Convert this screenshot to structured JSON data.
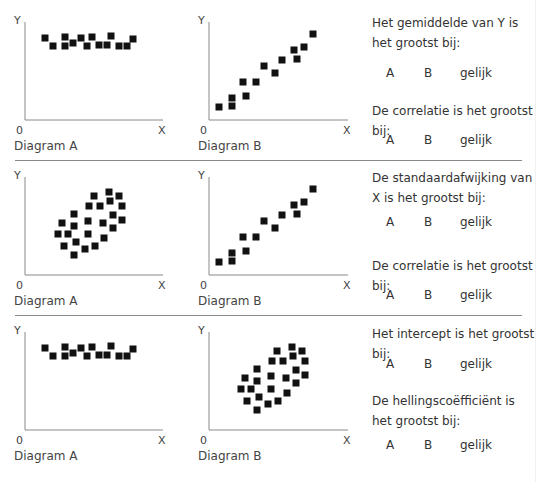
{
  "axis_labels": {
    "y": "Y",
    "x": "X",
    "origin": "0"
  },
  "rows": [
    {
      "diagram_a": {
        "caption": "Diagram A"
      },
      "diagram_b": {
        "caption": "Diagram B"
      },
      "questions": [
        {
          "text": "Het gemiddelde van Y is het grootst bij:",
          "options": [
            "A",
            "B",
            "gelijk"
          ]
        },
        {
          "text": "De correlatie is het grootst bij:",
          "options": [
            "A",
            "B",
            "gelijk"
          ]
        }
      ]
    },
    {
      "diagram_a": {
        "caption": "Diagram A"
      },
      "diagram_b": {
        "caption": "Diagram B"
      },
      "questions": [
        {
          "text": "De standaardafwijking van X is het grootst bij:",
          "options": [
            "A",
            "B",
            "gelijk"
          ]
        },
        {
          "text": "De correlatie is het grootst bij:",
          "options": [
            "A",
            "B",
            "gelijk"
          ]
        }
      ]
    },
    {
      "diagram_a": {
        "caption": "Diagram A"
      },
      "diagram_b": {
        "caption": "Diagram B"
      },
      "questions": [
        {
          "text": "Het intercept is het grootst bij:",
          "options": [
            "A",
            "B",
            "gelijk"
          ]
        },
        {
          "text": "De hellingscoëfficiënt is het grootst bij:",
          "options": [
            "A",
            "B",
            "gelijk"
          ]
        }
      ]
    }
  ],
  "colors": {
    "marker": "#111111",
    "axis": "#8a8a8a",
    "separator": "#8a8a8a",
    "text": "#333333"
  },
  "chart_data": [
    {
      "type": "scatter",
      "title": "Diagram A (rij 1)",
      "xlabel": "X",
      "ylabel": "Y",
      "points": [
        [
          20,
          82
        ],
        [
          28,
          74
        ],
        [
          40,
          83
        ],
        [
          40,
          74
        ],
        [
          48,
          77
        ],
        [
          56,
          82
        ],
        [
          62,
          74
        ],
        [
          67,
          83
        ],
        [
          74,
          75
        ],
        [
          82,
          75
        ],
        [
          86,
          84
        ],
        [
          94,
          74
        ],
        [
          102,
          74
        ],
        [
          108,
          81
        ]
      ]
    },
    {
      "type": "scatter",
      "title": "Diagram B (rij 1)",
      "xlabel": "X",
      "ylabel": "Y",
      "points": [
        [
          10,
          13
        ],
        [
          23,
          22
        ],
        [
          23,
          14
        ],
        [
          34,
          38
        ],
        [
          37,
          24
        ],
        [
          47,
          38
        ],
        [
          55,
          54
        ],
        [
          66,
          47
        ],
        [
          73,
          60
        ],
        [
          85,
          70
        ],
        [
          88,
          61
        ],
        [
          95,
          73
        ],
        [
          104,
          86
        ]
      ]
    },
    {
      "type": "scatter",
      "title": "Diagram A (rij 2)",
      "xlabel": "X",
      "ylabel": "Y",
      "points": [
        [
          69,
          79
        ],
        [
          84,
          83
        ],
        [
          94,
          79
        ],
        [
          64,
          69
        ],
        [
          75,
          69
        ],
        [
          85,
          74
        ],
        [
          97,
          69
        ],
        [
          49,
          61
        ],
        [
          63,
          54
        ],
        [
          78,
          52
        ],
        [
          88,
          60
        ],
        [
          97,
          55
        ],
        [
          37,
          52
        ],
        [
          49,
          49
        ],
        [
          88,
          47
        ],
        [
          33,
          41
        ],
        [
          43,
          41
        ],
        [
          63,
          41
        ],
        [
          79,
          37
        ],
        [
          39,
          29
        ],
        [
          51,
          33
        ],
        [
          70,
          29
        ],
        [
          60,
          26
        ],
        [
          49,
          20
        ]
      ]
    },
    {
      "type": "scatter",
      "title": "Diagram B (rij 2)",
      "xlabel": "X",
      "ylabel": "Y",
      "points": [
        [
          10,
          13
        ],
        [
          23,
          22
        ],
        [
          23,
          14
        ],
        [
          34,
          38
        ],
        [
          37,
          24
        ],
        [
          47,
          38
        ],
        [
          55,
          54
        ],
        [
          66,
          47
        ],
        [
          73,
          60
        ],
        [
          85,
          70
        ],
        [
          88,
          61
        ],
        [
          95,
          73
        ],
        [
          104,
          86
        ]
      ]
    },
    {
      "type": "scatter",
      "title": "Diagram A (rij 3)",
      "xlabel": "X",
      "ylabel": "Y",
      "points": [
        [
          20,
          82
        ],
        [
          28,
          74
        ],
        [
          40,
          83
        ],
        [
          40,
          74
        ],
        [
          48,
          77
        ],
        [
          56,
          82
        ],
        [
          62,
          74
        ],
        [
          67,
          83
        ],
        [
          74,
          75
        ],
        [
          82,
          75
        ],
        [
          86,
          84
        ],
        [
          94,
          74
        ],
        [
          102,
          74
        ],
        [
          108,
          81
        ]
      ]
    },
    {
      "type": "scatter",
      "title": "Diagram B (rij 3)",
      "xlabel": "X",
      "ylabel": "Y",
      "points": [
        [
          68,
          79
        ],
        [
          83,
          83
        ],
        [
          93,
          79
        ],
        [
          63,
          69
        ],
        [
          74,
          69
        ],
        [
          84,
          74
        ],
        [
          96,
          69
        ],
        [
          48,
          61
        ],
        [
          62,
          54
        ],
        [
          77,
          52
        ],
        [
          87,
          60
        ],
        [
          96,
          55
        ],
        [
          36,
          52
        ],
        [
          48,
          49
        ],
        [
          87,
          47
        ],
        [
          32,
          41
        ],
        [
          42,
          41
        ],
        [
          62,
          41
        ],
        [
          78,
          37
        ],
        [
          38,
          29
        ],
        [
          50,
          33
        ],
        [
          69,
          29
        ],
        [
          59,
          26
        ],
        [
          48,
          20
        ]
      ]
    }
  ]
}
